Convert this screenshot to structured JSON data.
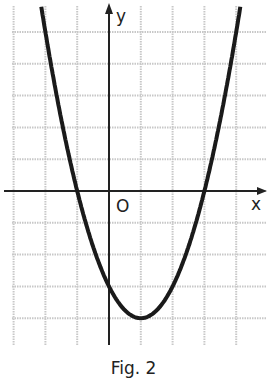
{
  "figure": {
    "caption": "Fig. 2"
  },
  "chart_data": {
    "type": "line",
    "title": "",
    "function": "y = x^2 - 2x - 3",
    "xlabel": "x",
    "ylabel": "y",
    "origin_label": "O",
    "xlim": [
      -3.4,
      4.9
    ],
    "ylim": [
      -5.0,
      5.9
    ],
    "grid": true,
    "grid_step": 1,
    "series": [
      {
        "name": "parabola",
        "x": [
          -2,
          -1.5,
          -1,
          -0.5,
          0,
          0.5,
          1,
          1.5,
          2,
          2.5,
          3,
          3.5,
          4
        ],
        "y": [
          5,
          2.25,
          0,
          -1.75,
          -3,
          -3.75,
          -4,
          -3.75,
          -3,
          -1.75,
          0,
          2.25,
          5
        ]
      }
    ],
    "key_points": {
      "roots": [
        -1,
        3
      ],
      "vertex": [
        1,
        -4
      ],
      "y_intercept": -3
    }
  }
}
